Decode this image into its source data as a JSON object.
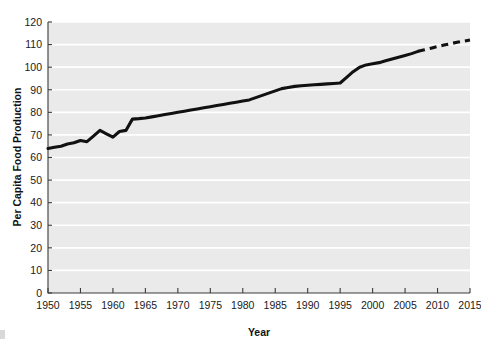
{
  "chart_data": {
    "type": "line",
    "title": "",
    "xlabel": "Year",
    "ylabel": "Per Capita Food Production",
    "xlim": [
      1950,
      2015
    ],
    "ylim": [
      0,
      120
    ],
    "grid": true,
    "legend": "none",
    "x_ticks": [
      1950,
      1955,
      1960,
      1965,
      1970,
      1975,
      1980,
      1985,
      1990,
      1995,
      2000,
      2005,
      2010,
      2015
    ],
    "y_ticks": [
      0,
      10,
      20,
      30,
      40,
      50,
      60,
      70,
      80,
      90,
      100,
      110,
      120
    ],
    "series": [
      {
        "name": "Per Capita Food Production",
        "style": "solid",
        "color": "#111111",
        "x": [
          1950,
          1951,
          1952,
          1953,
          1954,
          1955,
          1956,
          1957,
          1958,
          1959,
          1960,
          1961,
          1962,
          1963,
          1964,
          1965,
          1966,
          1967,
          1968,
          1969,
          1970,
          1971,
          1972,
          1973,
          1974,
          1975,
          1976,
          1977,
          1978,
          1979,
          1980,
          1981,
          1982,
          1983,
          1984,
          1985,
          1986,
          1987,
          1988,
          1989,
          1990,
          1991,
          1992,
          1993,
          1994,
          1995,
          1996,
          1997,
          1998,
          1999,
          2000,
          2001,
          2002,
          2003,
          2004,
          2005,
          2006,
          2007
        ],
        "values": [
          64,
          64.5,
          65,
          66,
          66.5,
          67.5,
          67,
          69.5,
          72,
          70.5,
          69,
          71.5,
          72,
          77,
          77.2,
          77.5,
          78,
          78.5,
          79,
          79.5,
          80,
          80.5,
          81,
          81.5,
          82,
          82.5,
          83,
          83.5,
          84,
          84.5,
          85,
          85.5,
          86.5,
          87.5,
          88.5,
          89.5,
          90.5,
          91,
          91.5,
          91.8,
          92,
          92.2,
          92.4,
          92.6,
          92.8,
          93,
          95.5,
          98,
          100,
          101,
          101.5,
          102,
          102.8,
          103.6,
          104.4,
          105.2,
          106,
          107
        ]
      },
      {
        "name": "Projection",
        "style": "dashed",
        "color": "#111111",
        "x": [
          2007,
          2008,
          2009,
          2010,
          2011,
          2012,
          2013,
          2014,
          2015
        ],
        "values": [
          107,
          107.7,
          108.4,
          109.1,
          109.8,
          110.4,
          111,
          111.5,
          112
        ]
      }
    ],
    "colors": {
      "plot_background": "#eaeaea",
      "gridline": "#ffffff",
      "axis": "#3a3a3a",
      "line": "#111111",
      "page_background": "#ffffff"
    }
  }
}
